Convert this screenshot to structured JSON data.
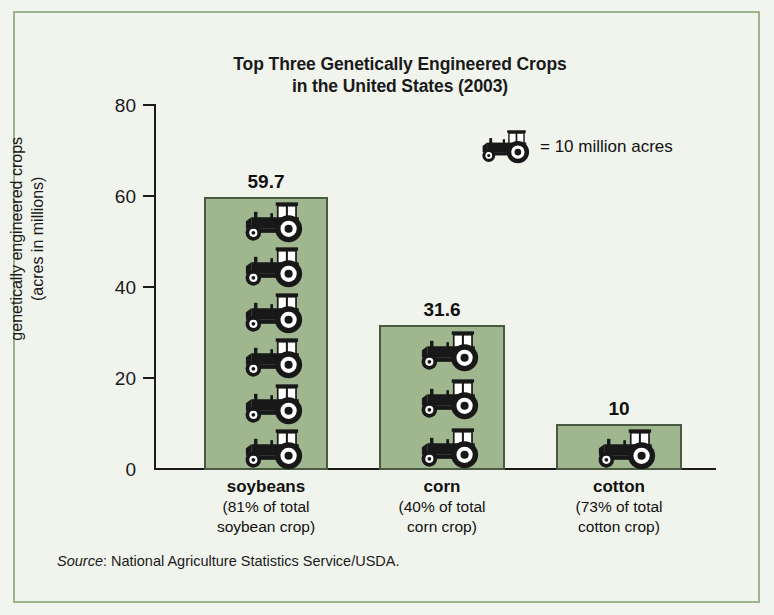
{
  "chart_data": {
    "type": "bar",
    "title": "Top Three Genetically Engineered Crops in the United States (2003)",
    "title_line1": "Top Three Genetically Engineered Crops",
    "title_line2": "in the United States (2003)",
    "categories": [
      "soybeans",
      "corn",
      "cotton"
    ],
    "category_sublabels": [
      [
        "(81% of total",
        "soybean crop)"
      ],
      [
        "(40% of total",
        "corn crop)"
      ],
      [
        "(73% of total",
        "cotton crop)"
      ]
    ],
    "values": [
      59.7,
      31.6,
      10
    ],
    "value_labels": [
      "59.7",
      "31.6",
      "10"
    ],
    "icon_counts": [
      6,
      3,
      1
    ],
    "xlabel": "",
    "ylabel": "genetically engineered crops (acres in millions)",
    "ylabel_line1": "genetically engineered crops",
    "ylabel_line2": "(acres in millions)",
    "ylim": [
      0,
      80
    ],
    "yticks": [
      0,
      20,
      40,
      60,
      80
    ],
    "ytick_labels": [
      "0",
      "20",
      "40",
      "60",
      "80"
    ],
    "grid": false,
    "legend_position": "upper-right",
    "legend": {
      "icon": "tractor-icon",
      "text": "= 10 million acres",
      "unit_value": 10,
      "unit_text": "million acres"
    },
    "source": {
      "label": "Source",
      "separator": ": ",
      "text": "National Agriculture Statistics Service/USDA."
    },
    "colors": {
      "bar_fill": "#9fb68f",
      "bar_border": "#4a5a42",
      "background": "#f1f4ed",
      "frame_border": "#9cb38c",
      "text": "#1a1a1a",
      "icon_dark": "#181818",
      "icon_light": "#ffffff"
    }
  }
}
